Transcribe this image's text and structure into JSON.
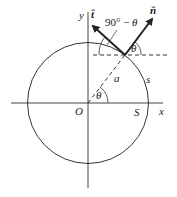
{
  "diagram": {
    "type": "unit-circle-tangent-normal",
    "labels": {
      "y_axis": "y",
      "x_axis": "x",
      "origin": "O",
      "point_S": "S",
      "arc_s": "s",
      "radius_a": "a",
      "theta_center": "θ",
      "theta_point": "θ",
      "angle_complement": "90° − θ",
      "tangent_vector": "t̂",
      "normal_vector": "n̂"
    },
    "colors": {
      "stroke": "#333333",
      "background": "#ffffff"
    }
  }
}
